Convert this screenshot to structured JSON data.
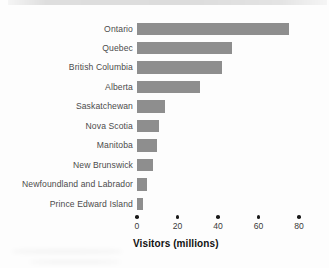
{
  "chart_data": {
    "type": "bar",
    "orientation": "horizontal",
    "title": "",
    "xlabel": "Visitors (millions)",
    "ylabel": "",
    "categories": [
      "Ontario",
      "Quebec",
      "British Columbia",
      "Alberta",
      "Saskatchewan",
      "Nova Scotia",
      "Manitoba",
      "New Brunswick",
      "Newfoundland and Labrador",
      "Prince Edward Island"
    ],
    "values": [
      75,
      47,
      42,
      31,
      14,
      11,
      10,
      8,
      5,
      3
    ],
    "xlim": [
      0,
      80
    ],
    "xticks": [
      0,
      20,
      40,
      60,
      80
    ],
    "xtick_labels": [
      "0",
      "20",
      "40",
      "60",
      "80"
    ],
    "grid": false,
    "legend_position": "none",
    "tick_marker": "dot"
  },
  "colors": {
    "bar": "#8e8e8e",
    "category_label": "#4c4c4c",
    "tick_label": "#3a3a3a",
    "tick_dot": "#1a1a1a",
    "axis_title": "#111111",
    "background": "#fdfdfd"
  }
}
